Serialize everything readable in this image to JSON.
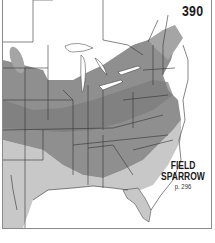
{
  "map": {
    "number": "390",
    "species": {
      "name_line1": "FIELD",
      "name_line2": "SPARROW",
      "page_ref": "p. 296"
    },
    "region": "Eastern United States and southeastern Canada",
    "legend_colors": {
      "out_of_range": "#ffffff",
      "winter": "#c8c8c8",
      "year_round": "#8f8f8f",
      "breeding": "#7a7a7a",
      "state_borders": "#333333",
      "frame": "#8a8a8a"
    }
  }
}
